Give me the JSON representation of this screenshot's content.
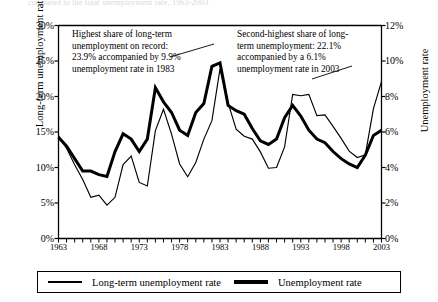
{
  "page": {
    "cut_off_header": "compared to the total unemployment rate, 1963-2003"
  },
  "axes": {
    "left_title": "Long-term unemployment rate",
    "right_title": "Unemployment rate",
    "left_ticks": [
      "0%",
      "5%",
      "10%",
      "15%",
      "20%",
      "25%",
      "30%"
    ],
    "right_ticks": [
      "0%",
      "2%",
      "4%",
      "6%",
      "8%",
      "10%",
      "12%"
    ],
    "x_ticks": [
      "1963",
      "1968",
      "1973",
      "1978",
      "1983",
      "1988",
      "1993",
      "1998",
      "2003"
    ]
  },
  "annotations": [
    {
      "id": "annotation-peak-1983",
      "text": "Highest share of long-term unemployment on record: 23.9% accompanied by 9.9% unemployment rate in 1983"
    },
    {
      "id": "annotation-peak-2003",
      "text": "Second-highest share of long-term unemployment: 22.1% accompanied by a 6.1% unemployment rate in 2003"
    }
  ],
  "legend": {
    "items": [
      {
        "label": "Long-term unemployment rate",
        "style": "thin"
      },
      {
        "label": "Unemployment rate",
        "style": "thick"
      }
    ]
  },
  "colors": {
    "line": "#000000",
    "axis": "#000000",
    "background": "#ffffff"
  },
  "chart_data": {
    "type": "line",
    "title": "",
    "xlabel": "",
    "ylabel": "Long-term unemployment rate",
    "y2label": "Unemployment rate",
    "xlim": [
      1963,
      2003
    ],
    "ylim": [
      0,
      30
    ],
    "y2lim": [
      0,
      12
    ],
    "grid": false,
    "legend_position": "bottom",
    "x": [
      1963,
      1964,
      1965,
      1966,
      1967,
      1968,
      1969,
      1970,
      1971,
      1972,
      1973,
      1974,
      1975,
      1976,
      1977,
      1978,
      1979,
      1980,
      1981,
      1982,
      1983,
      1984,
      1985,
      1986,
      1987,
      1988,
      1989,
      1990,
      1991,
      1992,
      1993,
      1994,
      1995,
      1996,
      1997,
      1998,
      1999,
      2000,
      2001,
      2002,
      2003
    ],
    "series": [
      {
        "name": "Unemployment rate",
        "axis": "right",
        "unit": "%",
        "style": "thick",
        "values": [
          5.7,
          5.2,
          4.5,
          3.8,
          3.8,
          3.6,
          3.5,
          4.9,
          5.9,
          5.6,
          4.9,
          5.6,
          8.5,
          7.7,
          7.1,
          6.1,
          5.8,
          7.1,
          7.6,
          9.7,
          9.9,
          7.5,
          7.2,
          7.0,
          6.2,
          5.5,
          5.3,
          5.6,
          6.8,
          7.5,
          6.9,
          6.1,
          5.6,
          5.4,
          4.9,
          4.5,
          4.2,
          4.0,
          4.7,
          5.8,
          6.1
        ]
      },
      {
        "name": "Long-term unemployment rate",
        "axis": "left",
        "unit": "%",
        "style": "thin",
        "values": [
          14.5,
          12.7,
          10.4,
          8.3,
          5.8,
          6.1,
          4.7,
          5.8,
          10.4,
          11.6,
          7.9,
          7.4,
          15.2,
          18.2,
          14.7,
          10.5,
          8.7,
          10.7,
          14.0,
          16.6,
          23.9,
          19.1,
          15.4,
          14.4,
          14.0,
          12.2,
          9.9,
          10.0,
          12.9,
          20.3,
          20.1,
          20.3,
          17.3,
          17.4,
          15.8,
          14.1,
          12.3,
          11.4,
          11.8,
          18.3,
          22.1
        ]
      }
    ]
  }
}
